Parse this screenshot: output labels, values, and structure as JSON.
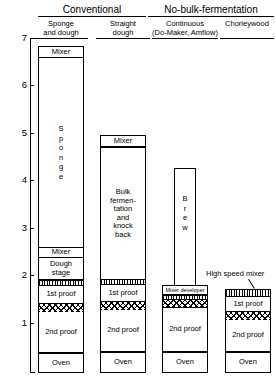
{
  "diagram": {
    "title_groups": [
      {
        "label": "Conventional"
      },
      {
        "label": "No-bulk-fermentation"
      }
    ],
    "axis": {
      "ticks": [
        "7",
        "6",
        "5",
        "4",
        "3",
        "2",
        "1"
      ],
      "unit_hint": ""
    },
    "columns": [
      {
        "header": "Sponge\nand dough",
        "header_line1": "Sponge",
        "header_line2": "and dough",
        "stages": [
          {
            "name": "mixer",
            "label": "Mixer"
          },
          {
            "name": "sponge",
            "label": "Sponge",
            "letters": [
              "S",
              "p",
              "o",
              "n",
              "g",
              "e"
            ]
          },
          {
            "name": "mixer-2",
            "label": "Mixer"
          },
          {
            "name": "dough-stage",
            "label": "Dough\nstage",
            "line1": "Dough",
            "line2": "stage"
          },
          {
            "name": "hatch-vertical",
            "label": ""
          },
          {
            "name": "first-proof",
            "label": "1st proof"
          },
          {
            "name": "hatch-zigzag",
            "label": ""
          },
          {
            "name": "second-proof",
            "label": "2nd proof"
          },
          {
            "name": "oven",
            "label": "Oven"
          }
        ]
      },
      {
        "header": "Straight\ndough",
        "header_line1": "Straight",
        "header_line2": "dough",
        "stages": [
          {
            "name": "mixer",
            "label": "Mixer"
          },
          {
            "name": "bulk-fermentation",
            "label": "Bulk fermen-tation and knock back",
            "lines": [
              "Bulk",
              "fermen-",
              "tation",
              "and",
              "knock",
              "back"
            ]
          },
          {
            "name": "hatch-vertical",
            "label": ""
          },
          {
            "name": "first-proof",
            "label": "1st proof"
          },
          {
            "name": "hatch-zigzag",
            "label": ""
          },
          {
            "name": "second-proof",
            "label": "2nd proof"
          },
          {
            "name": "oven",
            "label": "Oven"
          }
        ]
      },
      {
        "header": "Continuous\n(Do-Maker, Amflow)",
        "header_line1": "Continuous",
        "header_line2": "(Do-Maker, Amflow)",
        "stages": [
          {
            "name": "brew",
            "label": "Brew",
            "letters": [
              "B",
              "r",
              "e",
              "w"
            ]
          },
          {
            "name": "mixer-developer",
            "label": "Mixer developer"
          },
          {
            "name": "hatch-vertical",
            "label": ""
          },
          {
            "name": "hatch-zigzag",
            "label": ""
          },
          {
            "name": "second-proof",
            "label": "2nd proof"
          },
          {
            "name": "oven",
            "label": "Oven"
          }
        ]
      },
      {
        "header": "Chorleywood",
        "header_line1": "Chorleywood",
        "header_line2": "",
        "stages": [
          {
            "name": "high-speed-mixer",
            "label": "High speed mixer"
          },
          {
            "name": "hatch-vertical",
            "label": ""
          },
          {
            "name": "first-proof",
            "label": "1st proof"
          },
          {
            "name": "hatch-zigzag",
            "label": ""
          },
          {
            "name": "second-proof",
            "label": "2nd proof"
          },
          {
            "name": "oven",
            "label": "Oven"
          }
        ]
      }
    ]
  }
}
